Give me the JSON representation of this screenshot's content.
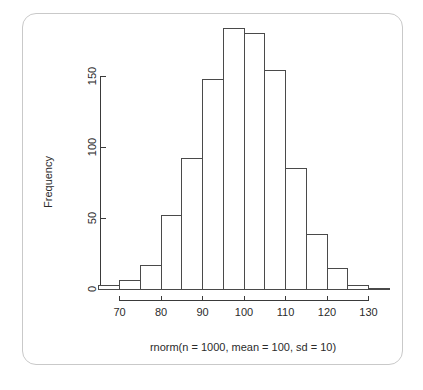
{
  "figure": {
    "frame_color": "#c9c9c9",
    "background": "#ffffff",
    "line_color": "#4a4a4a"
  },
  "chart_data": {
    "type": "bar",
    "title": "",
    "subtitle": "",
    "xlabel": "rnorm(n = 1000, mean = 100, sd = 10)",
    "ylabel": "Frequency",
    "xlim": [
      65,
      135
    ],
    "ylim": [
      0,
      190
    ],
    "grid": false,
    "legend": "none",
    "bin_width": 5,
    "x_ticks": [
      70,
      80,
      90,
      100,
      110,
      120,
      130
    ],
    "x_tick_labels": [
      "70",
      "80",
      "90",
      "100",
      "110",
      "120",
      "130"
    ],
    "y_ticks": [
      0,
      50,
      100,
      150
    ],
    "y_tick_labels": [
      "0",
      "50",
      "100",
      "150"
    ],
    "bins": [
      {
        "start": 65,
        "end": 70,
        "value": 3
      },
      {
        "start": 70,
        "end": 75,
        "value": 6
      },
      {
        "start": 75,
        "end": 80,
        "value": 17
      },
      {
        "start": 80,
        "end": 85,
        "value": 52
      },
      {
        "start": 85,
        "end": 90,
        "value": 92
      },
      {
        "start": 90,
        "end": 95,
        "value": 148
      },
      {
        "start": 95,
        "end": 100,
        "value": 184
      },
      {
        "start": 100,
        "end": 105,
        "value": 180
      },
      {
        "start": 105,
        "end": 110,
        "value": 154
      },
      {
        "start": 110,
        "end": 115,
        "value": 85
      },
      {
        "start": 115,
        "end": 120,
        "value": 39
      },
      {
        "start": 120,
        "end": 125,
        "value": 15
      },
      {
        "start": 125,
        "end": 130,
        "value": 3
      },
      {
        "start": 130,
        "end": 135,
        "value": 1
      }
    ],
    "categories": [
      "65-70",
      "70-75",
      "75-80",
      "80-85",
      "85-90",
      "90-95",
      "95-100",
      "100-105",
      "105-110",
      "110-115",
      "115-120",
      "120-125",
      "125-130",
      "130-135"
    ],
    "values": [
      3,
      6,
      17,
      52,
      92,
      148,
      184,
      180,
      154,
      85,
      39,
      15,
      3,
      1
    ]
  }
}
